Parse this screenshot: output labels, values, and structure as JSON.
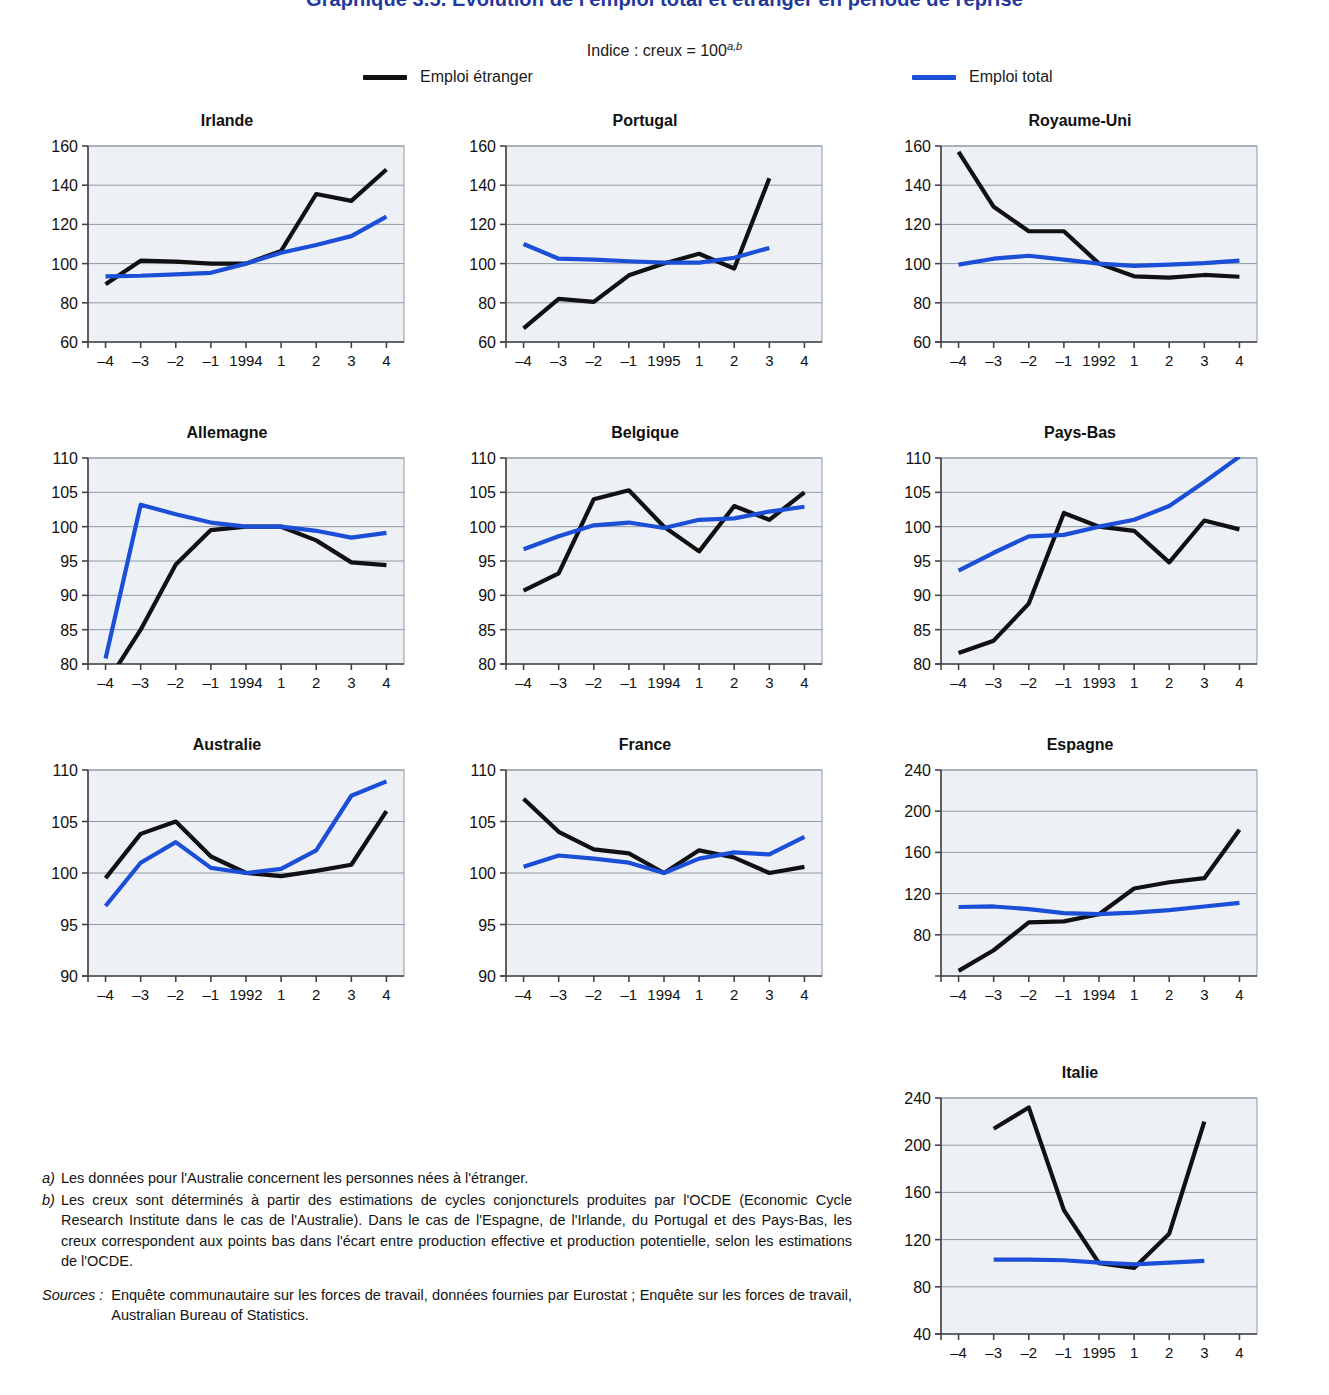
{
  "header": {
    "title": "Graphique 3.5.  Évolution de l'emploi total et étranger en période de reprise",
    "subtitle_main": "Indice : creux = 100",
    "subtitle_sup": "a,b",
    "legend": [
      {
        "label": "Emploi étranger",
        "color": "#111111"
      },
      {
        "label": "Emploi total",
        "color": "#1c4fd8"
      }
    ]
  },
  "colors": {
    "foreign": "#111111",
    "total": "#1c4fd8",
    "plot_bg": "#edf1f5",
    "grid": "#8f9aa4",
    "axis": "#555b61",
    "title_blue": "#24389c"
  },
  "notes": [
    {
      "key": "a)",
      "text": "Les données pour l'Australie concernent les personnes nées à l'étranger."
    },
    {
      "key": "b)",
      "text": "Les creux sont déterminés à partir des estimations de cycles conjoncturels produites par l'OCDE (Economic Cycle Research Institute dans le cas de l'Australie). Dans le cas de l'Espagne, de l'Irlande, du Portugal et des Pays-Bas, les creux correspondent aux points bas dans l'écart entre production effective et production potentielle, selon les estimations de l'OCDE."
    }
  ],
  "sources": {
    "key": "Sources :",
    "text": "Enquête communautaire sur les forces de travail, données fournies par Eurostat ; Enquête sur les forces de travail, Australian Bureau of Statistics."
  },
  "chart_data": [
    {
      "id": "irlande",
      "type": "line",
      "title": "Irlande",
      "xlabel": "",
      "ylabel": "",
      "grid": true,
      "ylim": [
        60,
        160
      ],
      "yticks": [
        60,
        80,
        100,
        120,
        140,
        160
      ],
      "x": [
        -4,
        -3,
        -2,
        -1,
        0,
        1,
        2,
        3,
        4
      ],
      "xticklabels": [
        "–4",
        "–3",
        "–2",
        "–1",
        "1994",
        "1",
        "2",
        "3",
        "4"
      ],
      "series": [
        {
          "name": "Emploi étranger",
          "color": "#111111",
          "values": [
            89.5,
            101.5,
            101.0,
            100.0,
            100.0,
            106.5,
            135.5,
            132.0,
            148.0
          ]
        },
        {
          "name": "Emploi total",
          "color": "#1c4fd8",
          "values": [
            93.5,
            93.8,
            94.5,
            95.3,
            100.0,
            105.5,
            109.5,
            114.0,
            124.0
          ]
        }
      ]
    },
    {
      "id": "portugal",
      "type": "line",
      "title": "Portugal",
      "xlabel": "",
      "ylabel": "",
      "grid": true,
      "ylim": [
        60,
        160
      ],
      "yticks": [
        60,
        80,
        100,
        120,
        140,
        160
      ],
      "x": [
        -4,
        -3,
        -2,
        -1,
        0,
        1,
        2,
        3,
        4
      ],
      "xticklabels": [
        "–4",
        "–3",
        "–2",
        "–1",
        "1995",
        "1",
        "2",
        "3",
        "4"
      ],
      "series": [
        {
          "name": "Emploi étranger",
          "color": "#111111",
          "values": [
            67.0,
            82.0,
            80.5,
            94.0,
            100.0,
            105.0,
            97.5,
            143.5,
            null
          ]
        },
        {
          "name": "Emploi total",
          "color": "#1c4fd8",
          "values": [
            110.0,
            102.5,
            102.0,
            101.2,
            100.5,
            100.5,
            103.0,
            108.0,
            null
          ]
        }
      ]
    },
    {
      "id": "royaume-uni",
      "type": "line",
      "title": "Royaume-Uni",
      "xlabel": "",
      "ylabel": "",
      "grid": true,
      "ylim": [
        60,
        160
      ],
      "yticks": [
        60,
        80,
        100,
        120,
        140,
        160
      ],
      "x": [
        -4,
        -3,
        -2,
        -1,
        0,
        1,
        2,
        3,
        4
      ],
      "xticklabels": [
        "–4",
        "–3",
        "–2",
        "–1",
        "1992",
        "1",
        "2",
        "3",
        "4"
      ],
      "series": [
        {
          "name": "Emploi étranger",
          "color": "#111111",
          "values": [
            157.0,
            129.0,
            116.5,
            116.5,
            100.0,
            93.5,
            92.8,
            94.2,
            93.3
          ]
        },
        {
          "name": "Emploi total",
          "color": "#1c4fd8",
          "values": [
            99.5,
            102.5,
            104.0,
            102.0,
            100.0,
            98.8,
            99.5,
            100.2,
            101.5
          ]
        }
      ]
    },
    {
      "id": "allemagne",
      "type": "line",
      "title": "Allemagne",
      "xlabel": "",
      "ylabel": "",
      "grid": true,
      "ylim": [
        80,
        110
      ],
      "yticks": [
        80,
        85,
        90,
        95,
        100,
        105,
        110
      ],
      "x": [
        -4,
        -3,
        -2,
        -1,
        0,
        1,
        2,
        3,
        4
      ],
      "xticklabels": [
        "–4",
        "–3",
        "–2",
        "–1",
        "1994",
        "1",
        "2",
        "3",
        "4"
      ],
      "series": [
        {
          "name": "Emploi étranger",
          "color": "#111111",
          "values": [
            77.0,
            85.0,
            94.5,
            99.5,
            100.0,
            100.0,
            98.0,
            94.8,
            94.4
          ]
        },
        {
          "name": "Emploi total",
          "color": "#1c4fd8",
          "values": [
            80.8,
            103.2,
            101.8,
            100.6,
            100.0,
            100.0,
            99.4,
            98.4,
            99.1
          ]
        }
      ]
    },
    {
      "id": "belgique",
      "type": "line",
      "title": "Belgique",
      "xlabel": "",
      "ylabel": "",
      "grid": true,
      "ylim": [
        80,
        110
      ],
      "yticks": [
        80,
        85,
        90,
        95,
        100,
        105,
        110
      ],
      "x": [
        -4,
        -3,
        -2,
        -1,
        0,
        1,
        2,
        3,
        4
      ],
      "xticklabels": [
        "–4",
        "–3",
        "–2",
        "–1",
        "1994",
        "1",
        "2",
        "3",
        "4"
      ],
      "series": [
        {
          "name": "Emploi étranger",
          "color": "#111111",
          "values": [
            90.7,
            93.2,
            104.0,
            105.3,
            100.0,
            96.4,
            103.0,
            101.0,
            105.0
          ]
        },
        {
          "name": "Emploi total",
          "color": "#1c4fd8",
          "values": [
            96.7,
            98.6,
            100.2,
            100.6,
            99.8,
            101.0,
            101.2,
            102.2,
            102.9
          ]
        }
      ]
    },
    {
      "id": "pays-bas",
      "type": "line",
      "title": "Pays-Bas",
      "xlabel": "",
      "ylabel": "",
      "grid": true,
      "ylim": [
        80,
        110
      ],
      "yticks": [
        80,
        85,
        90,
        95,
        100,
        105,
        110
      ],
      "x": [
        -4,
        -3,
        -2,
        -1,
        0,
        1,
        2,
        3,
        4
      ],
      "xticklabels": [
        "–4",
        "–3",
        "–2",
        "–1",
        "1993",
        "1",
        "2",
        "3",
        "4"
      ],
      "series": [
        {
          "name": "Emploi étranger",
          "color": "#111111",
          "values": [
            81.6,
            83.4,
            88.8,
            102.0,
            100.0,
            99.4,
            94.8,
            100.9,
            99.6
          ]
        },
        {
          "name": "Emploi total",
          "color": "#1c4fd8",
          "values": [
            93.6,
            96.2,
            98.6,
            98.8,
            100.0,
            101.0,
            103.0,
            106.5,
            110.2
          ]
        }
      ]
    },
    {
      "id": "australie",
      "type": "line",
      "title": "Australie",
      "xlabel": "",
      "ylabel": "",
      "grid": true,
      "ylim": [
        90,
        110
      ],
      "yticks": [
        90,
        95,
        100,
        105,
        110
      ],
      "x": [
        -4,
        -3,
        -2,
        -1,
        0,
        1,
        2,
        3,
        4
      ],
      "xticklabels": [
        "–4",
        "–3",
        "–2",
        "–1",
        "1992",
        "1",
        "2",
        "3",
        "4"
      ],
      "series": [
        {
          "name": "Emploi étranger",
          "color": "#111111",
          "values": [
            99.5,
            103.8,
            105.0,
            101.6,
            100.0,
            99.7,
            100.2,
            100.8,
            106.0
          ]
        },
        {
          "name": "Emploi total",
          "color": "#1c4fd8",
          "values": [
            96.8,
            101.0,
            103.0,
            100.5,
            100.0,
            100.4,
            102.2,
            107.5,
            108.9
          ]
        }
      ]
    },
    {
      "id": "france",
      "type": "line",
      "title": "France",
      "xlabel": "",
      "ylabel": "",
      "grid": true,
      "ylim": [
        90,
        110
      ],
      "yticks": [
        90,
        95,
        100,
        105,
        110
      ],
      "x": [
        -4,
        -3,
        -2,
        -1,
        0,
        1,
        2,
        3,
        4
      ],
      "xticklabels": [
        "–4",
        "–3",
        "–2",
        "–1",
        "1994",
        "1",
        "2",
        "3",
        "4"
      ],
      "series": [
        {
          "name": "Emploi étranger",
          "color": "#111111",
          "values": [
            107.2,
            104.0,
            102.3,
            101.9,
            100.0,
            102.2,
            101.5,
            100.0,
            100.6
          ]
        },
        {
          "name": "Emploi total",
          "color": "#1c4fd8",
          "values": [
            100.6,
            101.7,
            101.4,
            101.0,
            100.0,
            101.4,
            102.0,
            101.8,
            103.5
          ]
        }
      ]
    },
    {
      "id": "espagne",
      "type": "line",
      "title": "Espagne",
      "xlabel": "",
      "ylabel": "",
      "grid": true,
      "ylim": [
        40,
        240
      ],
      "yticks": [
        80,
        120,
        160,
        200,
        240
      ],
      "x": [
        -4,
        -3,
        -2,
        -1,
        0,
        1,
        2,
        3,
        4
      ],
      "xticklabels": [
        "–4",
        "–3",
        "–2",
        "–1",
        "1994",
        "1",
        "2",
        "3",
        "4"
      ],
      "series": [
        {
          "name": "Emploi étranger",
          "color": "#111111",
          "values": [
            45.0,
            65.0,
            92.0,
            93.0,
            100.0,
            125.0,
            131.0,
            135.0,
            182.0
          ]
        },
        {
          "name": "Emploi total",
          "color": "#1c4fd8",
          "values": [
            107.0,
            107.5,
            105.0,
            101.0,
            100.0,
            101.5,
            104.0,
            107.5,
            111.0
          ]
        }
      ]
    },
    {
      "id": "italie",
      "type": "line",
      "title": "Italie",
      "xlabel": "",
      "ylabel": "",
      "grid": true,
      "ylim": [
        40,
        240
      ],
      "yticks": [
        40,
        80,
        120,
        160,
        200,
        240
      ],
      "x": [
        -4,
        -3,
        -2,
        -1,
        0,
        1,
        2,
        3,
        4
      ],
      "xticklabels": [
        "–4",
        "–3",
        "–2",
        "–1",
        "1995",
        "1",
        "2",
        "3",
        "4"
      ],
      "series": [
        {
          "name": "Emploi étranger",
          "color": "#111111",
          "values": [
            null,
            214.0,
            232.0,
            145.0,
            100.0,
            96.0,
            125.0,
            220.0,
            null
          ]
        },
        {
          "name": "Emploi total",
          "color": "#1c4fd8",
          "values": [
            null,
            103.0,
            103.0,
            102.5,
            100.5,
            99.0,
            100.5,
            102.0,
            null
          ]
        }
      ]
    }
  ],
  "layout": {
    "panels": [
      {
        "id": "irlande",
        "left": 42,
        "top": 112,
        "w": 370,
        "h": 260
      },
      {
        "id": "portugal",
        "left": 460,
        "top": 112,
        "w": 370,
        "h": 260
      },
      {
        "id": "royaume-uni",
        "left": 895,
        "top": 112,
        "w": 370,
        "h": 260
      },
      {
        "id": "allemagne",
        "left": 42,
        "top": 424,
        "w": 370,
        "h": 270
      },
      {
        "id": "belgique",
        "left": 460,
        "top": 424,
        "w": 370,
        "h": 270
      },
      {
        "id": "pays-bas",
        "left": 895,
        "top": 424,
        "w": 370,
        "h": 270
      },
      {
        "id": "australie",
        "left": 42,
        "top": 736,
        "w": 370,
        "h": 270
      },
      {
        "id": "france",
        "left": 460,
        "top": 736,
        "w": 370,
        "h": 270
      },
      {
        "id": "espagne",
        "left": 895,
        "top": 736,
        "w": 370,
        "h": 270
      },
      {
        "id": "italie",
        "left": 895,
        "top": 1064,
        "w": 370,
        "h": 300
      }
    ]
  }
}
